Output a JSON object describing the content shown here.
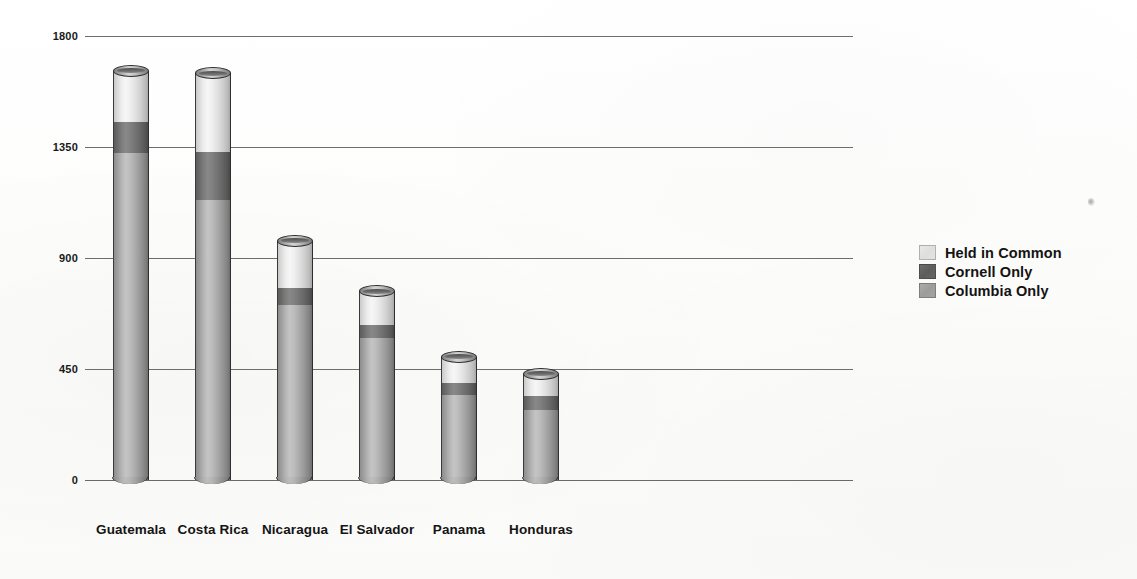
{
  "chart_data": {
    "type": "bar",
    "subtype": "stacked-cylinder-3d",
    "title": "",
    "subtitle": "",
    "xlabel": "",
    "ylabel": "",
    "grid": true,
    "ylim": [
      0,
      1800
    ],
    "yticks": [
      0,
      450,
      900,
      1350,
      1800
    ],
    "ytick_labels": [
      "0",
      "450",
      "900",
      "1350",
      "1800"
    ],
    "categories": [
      "Guatemala",
      "Costa Rica",
      "Nicaragua",
      "El Salvador",
      "Panama",
      "Honduras"
    ],
    "legend_position": "right",
    "series": [
      {
        "name": "Columbia Only",
        "color": "#a8a8a8",
        "values": [
          1325,
          1135,
          710,
          575,
          345,
          285
        ]
      },
      {
        "name": "Cornell Only",
        "color": "#5f5f5f",
        "values": [
          125,
          195,
          70,
          55,
          50,
          55
        ]
      },
      {
        "name": "Held in Common",
        "color": "#e6e6e6",
        "values": [
          210,
          320,
          190,
          135,
          105,
          90
        ]
      }
    ],
    "stack_order_bottom_to_top": [
      "Columbia Only",
      "Cornell Only",
      "Held in Common"
    ],
    "totals": [
      1660,
      1650,
      970,
      765,
      500,
      430
    ]
  },
  "legend": {
    "items": [
      {
        "label": "Held in Common",
        "swatch": "common"
      },
      {
        "label": "Cornell Only",
        "swatch": "cornell"
      },
      {
        "label": "Columbia Only",
        "swatch": "columbia"
      }
    ]
  }
}
